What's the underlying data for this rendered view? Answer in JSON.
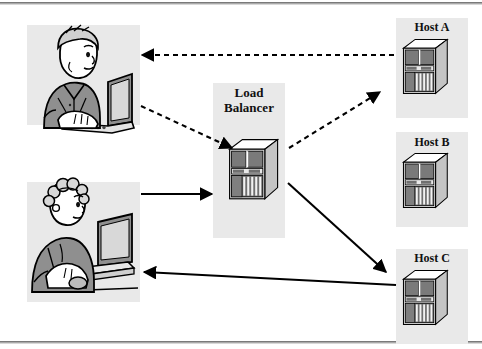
{
  "diagram": {
    "nodes": {
      "load_balancer": {
        "label": "Load\nBalancer",
        "icon": "server-tower-icon"
      },
      "host_a": {
        "label": "Host A",
        "icon": "server-tower-icon"
      },
      "host_b": {
        "label": "Host B",
        "icon": "server-tower-icon"
      },
      "host_c": {
        "label": "Host C",
        "icon": "server-tower-icon"
      },
      "client_top": {
        "icon": "person-at-laptop-icon"
      },
      "client_bottom": {
        "icon": "person-at-desktop-icon"
      }
    },
    "connections": [
      {
        "name": "host-a-to-client-top",
        "style": "dashed",
        "direction": "left"
      },
      {
        "name": "client-top-to-load-balancer",
        "style": "dashed",
        "direction": "down-right"
      },
      {
        "name": "load-balancer-to-host-a",
        "style": "dashed",
        "direction": "up-right"
      },
      {
        "name": "client-bottom-to-load-balancer",
        "style": "solid",
        "direction": "right"
      },
      {
        "name": "load-balancer-to-host-c",
        "style": "solid",
        "direction": "down-right"
      },
      {
        "name": "host-c-to-client-bottom",
        "style": "solid",
        "direction": "left"
      }
    ],
    "colors": {
      "panel": "#e9e9e9",
      "line": "#000000",
      "rule": "#7a7a7a",
      "figure_fill": "#9a9a9a",
      "server_dark": "#6f6f6f",
      "server_light": "#c9c9c9"
    }
  }
}
